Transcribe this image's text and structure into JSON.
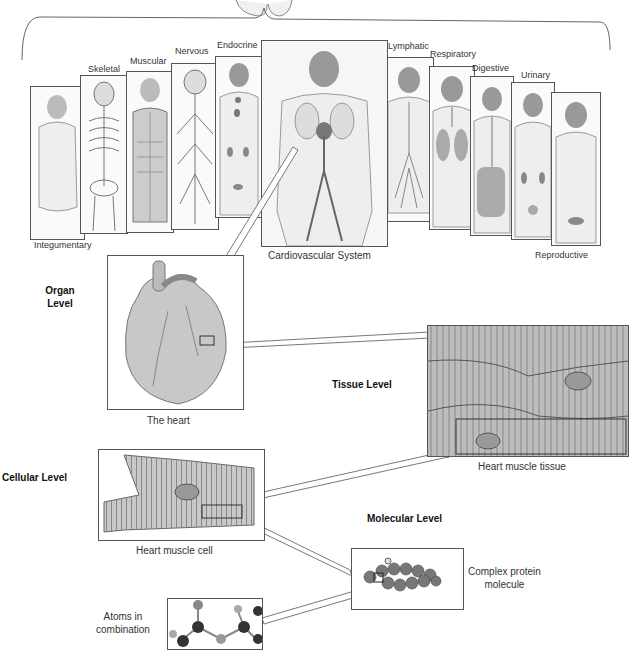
{
  "systems": [
    {
      "id": "integumentary",
      "label": "Integumentary"
    },
    {
      "id": "skeletal",
      "label": "Skeletal"
    },
    {
      "id": "muscular",
      "label": "Muscular"
    },
    {
      "id": "nervous",
      "label": "Nervous"
    },
    {
      "id": "endocrine",
      "label": "Endocrine"
    },
    {
      "id": "cardiovascular",
      "label": "Cardiovascular System"
    },
    {
      "id": "lymphatic",
      "label": "Lymphatic"
    },
    {
      "id": "respiratory",
      "label": "Respiratory"
    },
    {
      "id": "digestive",
      "label": "Digestive"
    },
    {
      "id": "urinary",
      "label": "Urinary"
    },
    {
      "id": "reproductive",
      "label": "Reproductive"
    }
  ],
  "levels": {
    "organ": {
      "label": "Organ\nLevel",
      "line1": "Organ",
      "line2": "Level",
      "caption": "The heart"
    },
    "tissue": {
      "label": "Tissue Level",
      "caption": "Heart muscle tissue"
    },
    "cellular": {
      "label": "Cellular Level",
      "caption": "Heart muscle cell"
    },
    "molecular": {
      "label": "Molecular Level",
      "caption_line1": "Complex protein",
      "caption_line2": "molecule"
    },
    "atomic": {
      "caption_line1": "Atoms in",
      "caption_line2": "combination"
    }
  },
  "colors": {
    "line": "#555555",
    "fill": "#d8d8d8",
    "dark": "#666666"
  }
}
